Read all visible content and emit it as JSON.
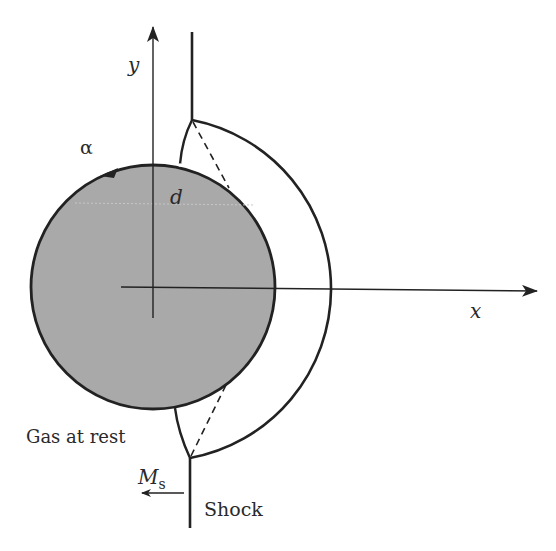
{
  "diagram": {
    "labels": {
      "y_axis": "y",
      "x_axis": "x",
      "alpha": "α",
      "d": "d",
      "gas_at_rest": "Gas at rest",
      "mach": "M",
      "mach_sub": "s",
      "shock": "Shock"
    },
    "colors": {
      "bubble_fill": "#a9a9a9",
      "stroke": "#222222",
      "background": "#ffffff"
    }
  }
}
